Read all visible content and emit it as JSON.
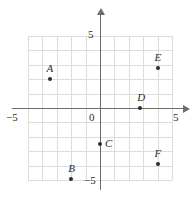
{
  "chart_data": {
    "type": "scatter",
    "title": "",
    "xlabel": "",
    "ylabel": "",
    "xlim": [
      -5,
      5
    ],
    "ylim": [
      -5,
      5
    ],
    "grid": true,
    "grid_step": 1,
    "legend": "none",
    "x_tick_labels": [
      {
        "text": "−5",
        "value": -5
      },
      {
        "text": "5",
        "value": 5
      }
    ],
    "y_tick_labels": [
      {
        "text": "5",
        "value": 5
      },
      {
        "text": "−5",
        "value": -5
      }
    ],
    "origin_label": "0",
    "points": [
      {
        "label": "A",
        "x": -3.5,
        "y": 2.0
      },
      {
        "label": "B",
        "x": -2.0,
        "y": -4.9
      },
      {
        "label": "C",
        "x": 0.0,
        "y": -2.5
      },
      {
        "label": "D",
        "x": 2.8,
        "y": 0.0
      },
      {
        "label": "E",
        "x": 4.0,
        "y": 2.8
      },
      {
        "label": "F",
        "x": 4.0,
        "y": -3.9
      }
    ],
    "colors": {
      "point": "#2b2b2b",
      "axis": "#6d6d6d",
      "grid": "#dcdcdc",
      "background": "#ffffff",
      "text": "#2b2b2b"
    }
  },
  "axis_labels": {
    "x_left": "−5",
    "x_right": "5",
    "y_top": "5",
    "y_bottom": "−5",
    "origin": "0"
  },
  "point_labels": {
    "a": "A",
    "b": "B",
    "c": "C",
    "d": "D",
    "e": "E",
    "f": "F"
  }
}
